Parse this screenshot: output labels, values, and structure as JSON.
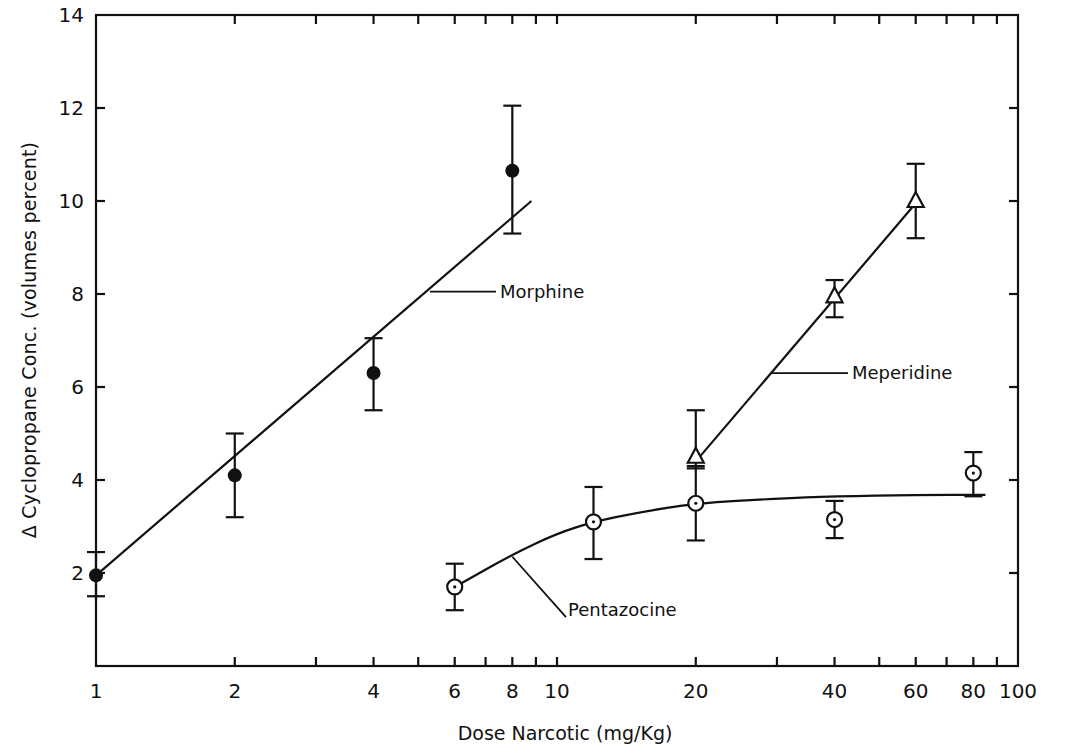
{
  "chart_data": {
    "type": "scatter",
    "title": "",
    "xlabel": "Dose Narcotic (mg/Kg)",
    "ylabel": "Δ Cyclopropane Conc. (volumes percent)",
    "xscale": "log",
    "xlim": [
      1,
      100
    ],
    "ylim": [
      0,
      14
    ],
    "grid": false,
    "legend": "inline labels",
    "x_tick_labels": [
      "1",
      "2",
      "4",
      "6",
      "8",
      "10",
      "20",
      "40",
      "60",
      "80",
      "100"
    ],
    "x_ticks": [
      1,
      2,
      3,
      4,
      5,
      6,
      7,
      8,
      9,
      10,
      20,
      30,
      40,
      50,
      60,
      70,
      80,
      90,
      100
    ],
    "y_tick_labels": [
      "2",
      "4",
      "6",
      "8",
      "10",
      "12",
      "14"
    ],
    "y_ticks": [
      2,
      4,
      6,
      8,
      10,
      12,
      14
    ],
    "series": [
      {
        "name": "Morphine",
        "marker": "filled-circle",
        "points": [
          {
            "x": 1,
            "y": 1.95,
            "err_low": 1.5,
            "err_high": 2.45
          },
          {
            "x": 2,
            "y": 4.1,
            "err_low": 3.2,
            "err_high": 5.0
          },
          {
            "x": 4,
            "y": 6.3,
            "err_low": 5.5,
            "err_high": 7.05
          },
          {
            "x": 8,
            "y": 10.65,
            "err_low": 9.3,
            "err_high": 12.05
          }
        ],
        "fit": {
          "type": "linear-in-log",
          "from": [
            1,
            1.95
          ],
          "to": [
            8.8,
            10.0
          ]
        }
      },
      {
        "name": "Meperidine",
        "marker": "open-triangle",
        "points": [
          {
            "x": 20,
            "y": 4.5,
            "err_low": 4.25,
            "err_high": 5.5
          },
          {
            "x": 40,
            "y": 7.95,
            "err_low": 7.5,
            "err_high": 8.3
          },
          {
            "x": 60,
            "y": 10.0,
            "err_low": 9.2,
            "err_high": 10.8
          }
        ],
        "fit": {
          "type": "linear-in-log",
          "from": [
            20,
            4.4
          ],
          "to": [
            60,
            9.95
          ]
        }
      },
      {
        "name": "Pentazocine",
        "marker": "dotted-circle",
        "points": [
          {
            "x": 6,
            "y": 1.7,
            "err_low": 1.2,
            "err_high": 2.2
          },
          {
            "x": 12,
            "y": 3.1,
            "err_low": 2.3,
            "err_high": 3.85
          },
          {
            "x": 20,
            "y": 3.5,
            "err_low": 2.7,
            "err_high": 4.3
          },
          {
            "x": 40,
            "y": 3.15,
            "err_low": 2.75,
            "err_high": 3.55
          },
          {
            "x": 80,
            "y": 4.15,
            "err_low": 3.65,
            "err_high": 4.6
          }
        ],
        "fit": {
          "type": "curve",
          "points": [
            [
              6,
              1.7
            ],
            [
              8,
              2.4
            ],
            [
              10,
              2.85
            ],
            [
              12,
              3.1
            ],
            [
              15,
              3.3
            ],
            [
              20,
              3.5
            ],
            [
              30,
              3.6
            ],
            [
              40,
              3.65
            ],
            [
              60,
              3.68
            ],
            [
              85,
              3.68
            ]
          ]
        }
      }
    ]
  }
}
